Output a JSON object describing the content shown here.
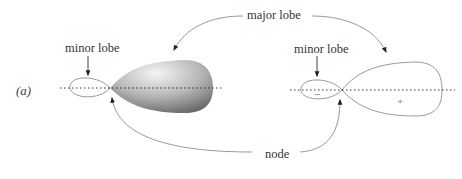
{
  "panel_label": "(a)",
  "labels": {
    "major_lobe": "major lobe",
    "minor_lobe_left": "minor lobe",
    "minor_lobe_right": "minor lobe",
    "node": "node"
  },
  "signs": {
    "minor": "−",
    "major": "+"
  },
  "colors": {
    "outline": "#999999",
    "axis": "#333333",
    "shade_light": "#f2f2f2",
    "shade_dark": "#6e6e6e",
    "text": "#333333"
  }
}
